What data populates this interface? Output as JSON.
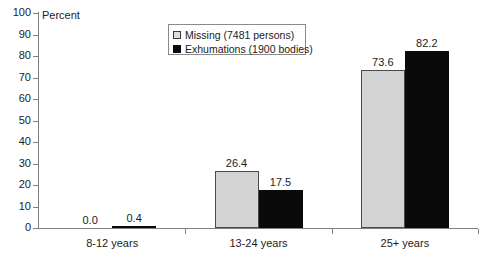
{
  "chart_data": {
    "type": "bar",
    "title": "",
    "subtitle": "",
    "xlabel": "",
    "ylabel": "Percent",
    "ylim": [
      0,
      100
    ],
    "ytick_step": 10,
    "yticks": [
      "100",
      "90",
      "80",
      "70",
      "60",
      "50",
      "40",
      "30",
      "20",
      "10",
      "0"
    ],
    "grid": false,
    "legend_position": "top-center",
    "categories": [
      "8-12 years",
      "13-24 years",
      "25+ years"
    ],
    "series": [
      {
        "name": "Missing (7481 persons)",
        "color": "#d4d4d4",
        "values": [
          0.0,
          26.4,
          73.6
        ],
        "labels": [
          "0.0",
          "26.4",
          "73.6"
        ]
      },
      {
        "name": "Exhumations (1900 bodies)",
        "color": "#0a0a0a",
        "values": [
          0.4,
          17.5,
          82.2
        ],
        "labels": [
          "0.4",
          "17.5",
          "82.2"
        ]
      }
    ]
  },
  "legend": {
    "items": [
      {
        "label": "Missing (7481 persons)",
        "swatch": "light"
      },
      {
        "label": "Exhumations (1900 bodies)",
        "swatch": "dark"
      }
    ]
  },
  "axes": {
    "y_title": "Percent"
  }
}
